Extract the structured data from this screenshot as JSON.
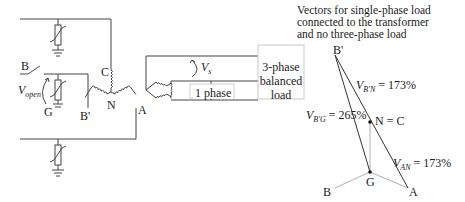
{
  "diagram": {
    "title_lines": [
      "Vectors for single-phase load",
      "connected to the transformer",
      "and no three-phase load"
    ],
    "schematic": {
      "labels": {
        "B": "B",
        "C": "C",
        "N": "N",
        "B_prime": "B'",
        "A": "A",
        "G": "G",
        "v_open_main": "V",
        "v_open_sub": "open",
        "v_s_main": "V",
        "v_s_sub": "s"
      },
      "load_box_lines": [
        "3-phase",
        "balanced",
        "load"
      ],
      "single_phase_label": "1 phase",
      "components": [
        {
          "type": "surge-arrester",
          "phase": "top"
        },
        {
          "type": "surge-arrester",
          "phase": "middle"
        },
        {
          "type": "surge-arrester",
          "phase": "bottom"
        },
        {
          "type": "open-switch",
          "phase": "B"
        },
        {
          "type": "wye-winding",
          "terminals": [
            "C",
            "B'",
            "A"
          ],
          "neutral": "N"
        },
        {
          "type": "delta-winding"
        }
      ]
    },
    "vector_diagram": {
      "points": {
        "B_prime": "B'",
        "N_eq_C": "N = C",
        "G": "G",
        "A": "A",
        "B": "B"
      },
      "annotations": {
        "vbg_main": "V",
        "vbg_sub": "B'G",
        "vbg_value": " = 265%",
        "vbn_main": "V",
        "vbn_sub": "B'N",
        "vbn_value": " = 173%",
        "van_main": "V",
        "van_sub": "AN",
        "van_value": " = 173%"
      }
    },
    "colors": {
      "line": "#333333",
      "light_line": "#bbbbbb",
      "box_border": "#c8c8c8"
    }
  }
}
